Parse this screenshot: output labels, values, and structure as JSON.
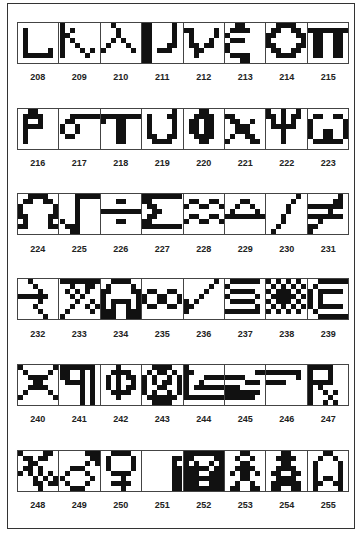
{
  "rows": [
    {
      "top": 22,
      "label_top": 72,
      "cells": [
        {
          "code": "208",
          "name": "iota-like hook",
          "bitmap": [
            "........",
            ".#......",
            ".#......",
            ".#......",
            ".#......",
            ".#....#.",
            ".######.",
            "........"
          ]
        },
        {
          "code": "209",
          "name": "kappa",
          "bitmap": [
            "#.......",
            "#.#.....",
            "##......",
            "#.#.....",
            "#..#....",
            "#...#.#.",
            "#....#..",
            "........"
          ]
        },
        {
          "code": "210",
          "name": "lambda",
          "bitmap": [
            "..#.....",
            "...#....",
            "...#....",
            "..#.#...",
            ".#...#..",
            "#.....#.",
            "........",
            "........"
          ]
        },
        {
          "code": "211",
          "name": "mu",
          "bitmap": [
            "##....#.",
            "##....#.",
            "##....#.",
            "##....#.",
            "##...##.",
            "##.###..",
            "##......",
            "##......"
          ]
        },
        {
          "code": "212",
          "name": "nu",
          "bitmap": [
            "........",
            "##....#.",
            ".#....#.",
            ".#...#..",
            ".##.##..",
            "..##....",
            "..#.....",
            "........"
          ]
        },
        {
          "code": "213",
          "name": "xi",
          "bitmap": [
            "..##....",
            ".####...",
            "#.......",
            ".###....",
            "#.......",
            "#.......",
            ".####...",
            "...##..."
          ]
        },
        {
          "code": "214",
          "name": "omicron",
          "bitmap": [
            "..####..",
            ".##..##.",
            "##....##",
            "#......#",
            "##....##",
            ".##..##.",
            "..####..",
            "........"
          ]
        },
        {
          "code": "215",
          "name": "pi",
          "bitmap": [
            "........",
            "########",
            ".##..##.",
            ".##..##.",
            ".##..##.",
            ".##..##.",
            ".##..##.",
            "........"
          ]
        }
      ]
    },
    {
      "top": 108,
      "label_top": 158,
      "cells": [
        {
          "code": "216",
          "name": "rho",
          "bitmap": [
            "..##....",
            ".####...",
            ".#..#...",
            ".####...",
            ".#......",
            ".#......",
            ".#......",
            "........"
          ]
        },
        {
          "code": "217",
          "name": "sigma",
          "bitmap": [
            "........",
            "..######",
            ".##.....",
            "#..#....",
            "#..#....",
            ".##.....",
            "........",
            "........"
          ]
        },
        {
          "code": "218",
          "name": "tau",
          "bitmap": [
            "........",
            "########",
            "#..##...",
            "...##...",
            "...##...",
            "...##...",
            "...##...",
            "........"
          ]
        },
        {
          "code": "219",
          "name": "upsilon",
          "bitmap": [
            "......#.",
            ".#...##.",
            ".#....#.",
            ".#....#.",
            ".#....#.",
            ".##..##.",
            "..####..",
            "........"
          ]
        },
        {
          "code": "220",
          "name": "phi",
          "bitmap": [
            "...##...",
            "..####..",
            ".##.##..",
            ".##.##..",
            ".##.##..",
            "..####..",
            "...##...",
            "........"
          ]
        },
        {
          "code": "221",
          "name": "chi",
          "bitmap": [
            "........",
            "##......",
            ".##..#..",
            "..###...",
            "..###...",
            ".#..##..",
            "#....##.",
            "........"
          ]
        },
        {
          "code": "222",
          "name": "psi",
          "bitmap": [
            "#..#..#.",
            "##.#.##.",
            ".#.#.#..",
            ".#####..",
            "...#....",
            "...#....",
            "...#....",
            "........"
          ]
        },
        {
          "code": "223",
          "name": "omega",
          "bitmap": [
            "........",
            ".##..##.",
            "#......#",
            "#......#",
            "#..##..#",
            "#..##..#",
            ".######.",
            "........"
          ]
        }
      ]
    },
    {
      "top": 193,
      "label_top": 244,
      "cells": [
        {
          "code": "224",
          "name": "Omega",
          "bitmap": [
            "..####..",
            ".##..##.",
            "#......#",
            "#......#",
            "##....##",
            ".#....#.",
            "##....##",
            "........"
          ]
        },
        {
          "code": "225",
          "name": "square-root",
          "bitmap": [
            "...#####",
            "...#....",
            "...#....",
            "...#....",
            "...#....",
            "#..#....",
            ".###....",
            "..##...."
          ]
        },
        {
          "code": "226",
          "name": "division",
          "bitmap": [
            "........",
            "...##...",
            "........",
            "########",
            "........",
            "...##...",
            "........",
            "........"
          ]
        },
        {
          "code": "227",
          "name": "Sigma",
          "bitmap": [
            "########",
            "##......",
            ".##.....",
            "..##....",
            ".##.....",
            "##......",
            "########",
            "........"
          ]
        },
        {
          "code": "228",
          "name": "approximately-equal",
          "bitmap": [
            "........",
            ".##..##.",
            "#..##..#",
            "........",
            ".##..##.",
            "#..##..#",
            "........",
            "........"
          ]
        },
        {
          "code": "229",
          "name": "triangle",
          "bitmap": [
            "........",
            "...##...",
            "..#..#..",
            ".#....#.",
            "########",
            "........",
            "........",
            "........"
          ]
        },
        {
          "code": "230",
          "name": "integral",
          "bitmap": [
            "......#.",
            ".....#..",
            "....#...",
            "....#...",
            "...#....",
            "...#....",
            "..#.....",
            ".#......"
          ]
        },
        {
          "code": "231",
          "name": "not-equal",
          "bitmap": [
            "......#.",
            ".....##.",
            "#######.",
            "....#...",
            "#######.",
            "..#.....",
            "##......",
            "#......."
          ]
        }
      ]
    },
    {
      "top": 278,
      "label_top": 329,
      "cells": [
        {
          "code": "232",
          "name": "arrow-left-staircase",
          "bitmap": [
            "..#.....",
            "...#....",
            "....#...",
            "######..",
            "....#...",
            "...#....",
            "....#...",
            ".....#.."
          ]
        },
        {
          "code": "233",
          "name": "percent",
          "bitmap": [
            "########",
            "..#..##.",
            ".#.#.#..",
            "..#.#...",
            "...#..#.",
            "..#..#.#",
            ".#....#.",
            "#......."
          ]
        },
        {
          "code": "234",
          "name": "arch",
          "bitmap": [
            "..####..",
            ".#....#.",
            "##....##",
            "#......#",
            "#.####.#",
            "#.#..#.#",
            "###..###",
            "###..###"
          ]
        },
        {
          "code": "235",
          "name": "infinity",
          "bitmap": [
            "........",
            "........",
            ".##..##.",
            "#..##..#",
            "#..##..#",
            ".##..##.",
            "........",
            "........"
          ]
        },
        {
          "code": "236",
          "name": "check-mark",
          "bitmap": [
            "......#.",
            ".....#..",
            "....#...",
            "...#....",
            "#.#.....",
            "##......",
            "#.......",
            "........"
          ]
        },
        {
          "code": "237",
          "name": "section-sign",
          "bitmap": [
            ".######.",
            "#.......",
            ".#####..",
            "#.....#.",
            ".#####..",
            "......#.",
            "#######.",
            "........"
          ]
        },
        {
          "code": "238",
          "name": "checker-pattern",
          "bitmap": [
            "#.#.#.#.",
            ".#.#.#.#",
            "#.###.#.",
            ".#####.#",
            "#.###.#.",
            ".#.#.#.#",
            "#.#.#.#.",
            "........"
          ]
        },
        {
          "code": "239",
          "name": "copyright",
          "bitmap": [
            "..######",
            ".#......",
            "#.#####.",
            "#.#.....",
            "#.#.....",
            "#.#####.",
            ".#......",
            "..######"
          ]
        }
      ]
    },
    {
      "top": 364,
      "label_top": 414,
      "cells": [
        {
          "code": "240",
          "name": "spool-x",
          "bitmap": [
            "#......#",
            ".#....#.",
            "..####..",
            "...##...",
            "..####..",
            ".#....#.",
            "#......#",
            "........"
          ]
        },
        {
          "code": "241",
          "name": "pilcrow",
          "bitmap": [
            "#######.",
            "##..#.#.",
            "##..#.#.",
            ".####.#.",
            "....#.#.",
            "....#.#.",
            "....#.#.",
            "....#.#."
          ]
        },
        {
          "code": "242",
          "name": "phi-alt",
          "bitmap": [
            "...#....",
            "..####..",
            ".#.#.##.",
            ".#.#..#.",
            ".#.#.##.",
            "..####..",
            "...#....",
            "........"
          ]
        },
        {
          "code": "243",
          "name": "registered",
          "bitmap": [
            "..####..",
            ".#.##.#.",
            "#.#..#.#",
            "#.#.##.#",
            "#..##..#",
            "#.#..#.#",
            ".######.",
            "..####.."
          ]
        },
        {
          "code": "244",
          "name": "logo-left",
          "bitmap": [
            "#.......",
            "##......",
            "#...####",
            "#..#....",
            "#.######",
            "#.......",
            "########",
            "........"
          ]
        },
        {
          "code": "245",
          "name": "logo-middle",
          "bitmap": [
            "........",
            "......##",
            "####....",
            "....###.",
            "###.....",
            "#######.",
            "######..",
            "........"
          ]
        },
        {
          "code": "246",
          "name": "logo-right",
          "bitmap": [
            "........",
            "#######.",
            "......#.",
            "####....",
            "........",
            "........",
            "........",
            "........"
          ]
        },
        {
          "code": "247",
          "name": "prescription",
          "bitmap": [
            "#####...",
            "#...#...",
            "#...#...",
            "#####...",
            "#.#.....",
            "#..#.#..",
            "#...#...",
            "#..#.#.."
          ]
        }
      ]
    },
    {
      "top": 450,
      "label_top": 500,
      "cells": [
        {
          "code": "248",
          "name": "spider-left",
          "bitmap": [
            "#....##.",
            ".##.##..",
            "..##....",
            ".##.#...",
            "#.#.#.#.",
            "...#.#.#",
            "...##.##",
            "....#..."
          ]
        },
        {
          "code": "249",
          "name": "male-sign",
          "bitmap": [
            ".....###",
            "......##",
            ".....#.#",
            "..###...",
            ".#...#..",
            "#.....#.",
            ".#...#..",
            "..###..."
          ]
        },
        {
          "code": "250",
          "name": "female-sign",
          "bitmap": [
            "..####..",
            ".#....#.",
            ".#....#.",
            ".#....#.",
            "..####..",
            "....#...",
            "..####..",
            "....#..."
          ]
        },
        {
          "code": "251",
          "name": "inverse-corner",
          "bitmap": [
            "........",
            "......##",
            "......#.",
            "......##",
            "......##",
            "......##",
            "......##",
            "......##"
          ]
        },
        {
          "code": "252",
          "name": "inverse-question",
          "bitmap": [
            "########",
            "##....##",
            "#.#..#.#",
            "#####.##",
            "###..###",
            "########",
            "###..###",
            "########"
          ]
        },
        {
          "code": "253",
          "name": "man-figure",
          "bitmap": [
            "...##...",
            "..#..#..",
            "...##...",
            "..####..",
            ".#.##.#.",
            "...##...",
            "..#..#..",
            ".##..##."
          ]
        },
        {
          "code": "254",
          "name": "woman-figure",
          "bitmap": [
            "...##...",
            "..####..",
            "...##...",
            "..####..",
            ".##..##.",
            "..####..",
            ".######.",
            ".##..##."
          ]
        },
        {
          "code": "255",
          "name": "arch-rocket",
          "bitmap": [
            "...##...",
            "..#..#..",
            ".#....#.",
            ".#....#.",
            ".#....#.",
            ".#.##.#.",
            ".##..##.",
            ".#....#."
          ]
        }
      ]
    }
  ]
}
